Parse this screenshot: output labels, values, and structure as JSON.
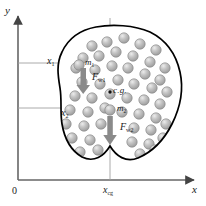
{
  "figure": {
    "background_color": "#ffffff",
    "outline_color": "#000000",
    "axis_color": "#555555",
    "guide_color": "#9a9a9a",
    "arrow_color": "#7d7d7d",
    "sphere_fill": "#b0b0b0",
    "sphere_highlight": "#e2e2e2",
    "sphere_stroke": "#8e8e8e"
  },
  "axes": {
    "y_label": "y",
    "x_label": "x",
    "origin_label": "0",
    "x_cg_label": "x",
    "x_cg_sub": "cg"
  },
  "guides": [
    {
      "name": "x1",
      "label": "x",
      "sub": "1"
    },
    {
      "name": "x2",
      "label": "x",
      "sub": "2"
    }
  ],
  "annotations": {
    "mass1": {
      "label": "m",
      "sub": "1"
    },
    "mass2": {
      "label": "m",
      "sub": "2"
    },
    "force1": {
      "label": "F",
      "sub": "w1"
    },
    "force2": {
      "label": "F",
      "sub": "w2"
    },
    "cg": "c.g."
  },
  "chart_data": {
    "type": "scatter",
    "xlabel": "x",
    "ylabel": "y",
    "grid": false,
    "legend": false,
    "annotations": [
      {
        "text": "x1",
        "kind": "guide-line",
        "y_px": 63
      },
      {
        "text": "x2",
        "kind": "guide-line",
        "y_px": 108
      },
      {
        "text": "x_cg",
        "kind": "guide-line",
        "x_px": 110
      },
      {
        "text": "m1",
        "kind": "point-label",
        "x_px": 80,
        "y_px": 66
      },
      {
        "text": "m2",
        "kind": "point-label",
        "x_px": 110,
        "y_px": 110
      },
      {
        "text": "F_w1",
        "kind": "vector-down",
        "x_px": 84,
        "y_px": 68
      },
      {
        "text": "F_w2",
        "kind": "vector-down",
        "x_px": 110,
        "y_px": 116
      },
      {
        "text": "c.g.",
        "kind": "point-label",
        "x_px": 110,
        "y_px": 92
      }
    ],
    "particles_px": [
      [
        92,
        46
      ],
      [
        107,
        42
      ],
      [
        124,
        38
      ],
      [
        140,
        44
      ],
      [
        156,
        50
      ],
      [
        83,
        58
      ],
      [
        99,
        56
      ],
      [
        116,
        52
      ],
      [
        133,
        56
      ],
      [
        150,
        62
      ],
      [
        165,
        68
      ],
      [
        76,
        68
      ],
      [
        95,
        70
      ],
      [
        112,
        66
      ],
      [
        128,
        68
      ],
      [
        145,
        74
      ],
      [
        160,
        80
      ],
      [
        82,
        82
      ],
      [
        100,
        84
      ],
      [
        118,
        80
      ],
      [
        134,
        84
      ],
      [
        152,
        88
      ],
      [
        167,
        92
      ],
      [
        75,
        96
      ],
      [
        92,
        98
      ],
      [
        110,
        94
      ],
      [
        127,
        98
      ],
      [
        144,
        100
      ],
      [
        160,
        104
      ],
      [
        70,
        110
      ],
      [
        88,
        112
      ],
      [
        105,
        108
      ],
      [
        122,
        112
      ],
      [
        139,
        114
      ],
      [
        156,
        118
      ],
      [
        66,
        124
      ],
      [
        84,
        126
      ],
      [
        101,
        124
      ],
      [
        134,
        128
      ],
      [
        151,
        130
      ],
      [
        166,
        124
      ],
      [
        72,
        138
      ],
      [
        90,
        140
      ],
      [
        132,
        142
      ],
      [
        149,
        144
      ],
      [
        163,
        138
      ],
      [
        80,
        152
      ],
      [
        98,
        150
      ],
      [
        140,
        154
      ],
      [
        155,
        150
      ]
    ],
    "blob_path": "M 96 27 C 80 30, 68 39, 62 52 C 56 64, 58 76, 60 88 C 62 100, 60 112, 62 124 C 64 136, 70 150, 82 157 C 94 163, 104 156, 110 146 C 116 156, 126 163, 138 158 C 152 152, 164 140, 172 124 C 180 108, 184 90, 180 72 C 176 54, 166 40, 150 32 C 134 25, 112 24, 96 27 Z"
  }
}
